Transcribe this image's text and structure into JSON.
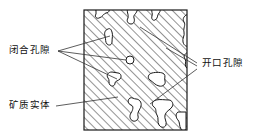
{
  "figure": {
    "title": "",
    "type": "schematic-cross-section",
    "colors": {
      "hatch": "#3a3a3a",
      "outline": "#1a1a1a",
      "pore_fill": "#ffffff",
      "background": "#ffffff",
      "leader": "#333333",
      "text": "#111111"
    },
    "box": {
      "x": 84,
      "y": 10,
      "width": 103,
      "height": 120
    }
  },
  "labels": {
    "closed_pores": "闭合孔隙",
    "open_pores": "开口孔隙",
    "mineral_solid": "矿质实体"
  },
  "leaders": {
    "closed_pores_origin": {
      "x": 58,
      "y": 51
    },
    "closed_pores_targets": [
      {
        "x": 110,
        "y": 36
      },
      {
        "x": 130,
        "y": 60
      },
      {
        "x": 118,
        "y": 78
      }
    ],
    "open_pores_origin": {
      "x": 197,
      "y": 65
    },
    "open_pores_targets": [
      {
        "x": 139,
        "y": 26
      },
      {
        "x": 163,
        "y": 47
      },
      {
        "x": 150,
        "y": 103
      }
    ],
    "mineral_solid_origin": {
      "x": 56,
      "y": 106
    },
    "mineral_solid_target": {
      "x": 115,
      "y": 98
    }
  },
  "pores": {
    "closed": [
      {
        "name": "closed-pore-circle",
        "cx": 130,
        "cy": 60,
        "r": 4
      },
      {
        "name": "closed-pore-upper",
        "cx": 110,
        "cy": 36
      },
      {
        "name": "closed-pore-lower",
        "cx": 118,
        "cy": 78
      }
    ],
    "open": [
      {
        "name": "open-pore-top-left",
        "edge": "top"
      },
      {
        "name": "open-pore-top-mid",
        "edge": "top"
      },
      {
        "name": "open-pore-right-upper",
        "edge": "right"
      },
      {
        "name": "open-pore-right-mid",
        "edge": "right"
      },
      {
        "name": "open-pore-bottom-left",
        "edge": "bottom"
      },
      {
        "name": "open-pore-bottom-right",
        "edge": "bottom"
      }
    ]
  }
}
